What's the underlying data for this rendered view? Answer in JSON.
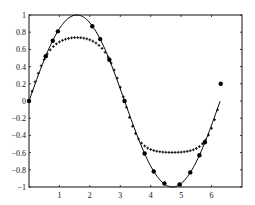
{
  "chart_data": {
    "type": "line",
    "title": "",
    "xlabel": "",
    "ylabel": "",
    "xlim": [
      0,
      7
    ],
    "ylim": [
      -1,
      1
    ],
    "grid": false,
    "legend": null,
    "xticks": [
      1,
      2,
      3,
      4,
      5,
      6
    ],
    "xtick_labels": [
      "1",
      "2",
      "3",
      "4",
      "5",
      "6"
    ],
    "yticks": [
      -1,
      -0.8,
      -0.6,
      -0.4,
      -0.2,
      0,
      0.2,
      0.4,
      0.6,
      0.8,
      1
    ],
    "ytick_labels": [
      "-1",
      "-0.8",
      "-0.6",
      "-0.4",
      "-0.2",
      "0",
      "0.2",
      "0.4",
      "0.6",
      "0.8",
      "1"
    ],
    "series": [
      {
        "name": "sin(x)",
        "style": "solid-line",
        "color": "#000000",
        "function": "sin",
        "x_range": [
          0,
          6.28
        ]
      },
      {
        "name": "samples",
        "style": "filled-circle",
        "color": "#000000",
        "points": [
          [
            0.0,
            0.0
          ],
          [
            0.55,
            0.52
          ],
          [
            0.78,
            0.7
          ],
          [
            0.95,
            0.81
          ],
          [
            2.08,
            0.87
          ],
          [
            2.34,
            0.72
          ],
          [
            2.64,
            0.48
          ],
          [
            3.14,
            0.0
          ],
          [
            3.8,
            -0.61
          ],
          [
            4.1,
            -0.82
          ],
          [
            4.45,
            -0.96
          ],
          [
            4.95,
            -0.97
          ],
          [
            5.3,
            -0.83
          ],
          [
            5.6,
            -0.63
          ],
          [
            5.78,
            -0.48
          ],
          [
            6.3,
            0.2
          ]
        ]
      },
      {
        "name": "network output",
        "style": "plus-markers",
        "color": "#000000",
        "x_start": 0.0,
        "x_step": 0.1,
        "count": 63,
        "clip_high": 0.84,
        "clip_low": -0.62
      }
    ]
  }
}
